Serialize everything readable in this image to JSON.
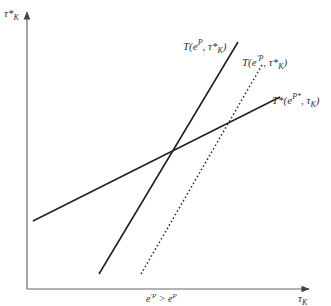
{
  "diagram": {
    "type": "economic-reaction-functions",
    "axes": {
      "y_label": {
        "base": "τ*",
        "sub": "K"
      },
      "x_label": {
        "base": "τ",
        "sub": "K"
      },
      "color": "#555555"
    },
    "curves": [
      {
        "id": "T-eP",
        "label_pre": "T(e",
        "label_sup": "P",
        "label_mid": ", τ*",
        "label_sub": "K",
        "label_post": ")",
        "style": "solid",
        "color": "#222222"
      },
      {
        "id": "T-eprimeP",
        "label_pre": "T(e",
        "label_sup": "′P",
        "label_mid": ", τ*",
        "label_sub": "K",
        "label_post": ")",
        "style": "dotted",
        "color": "#333333"
      },
      {
        "id": "Tstar-ePstar",
        "label_pre": "T*(e",
        "label_sup": "P*",
        "label_mid": ", τ",
        "label_sub": "K",
        "label_post": ")",
        "style": "solid",
        "color": "#222222"
      }
    ],
    "annotation": {
      "pre": "e",
      "sup1": "′P",
      "mid": " > e",
      "sup2": "P"
    }
  }
}
